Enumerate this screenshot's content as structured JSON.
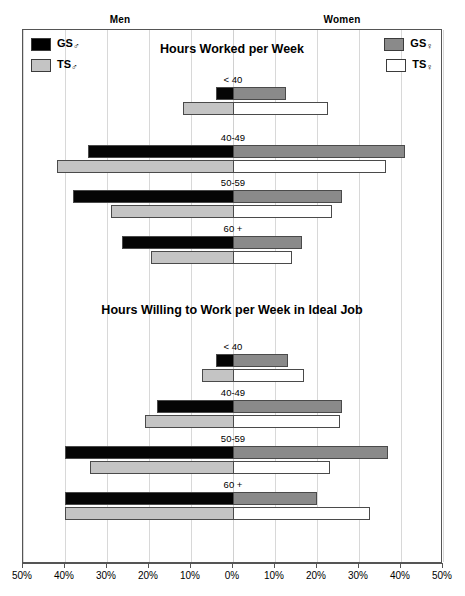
{
  "header": {
    "men_label": "Men",
    "women_label": "Women"
  },
  "legend_left": {
    "items": [
      {
        "key": "gs_m",
        "label": "GS",
        "symbol": "♂",
        "color": "#000000"
      },
      {
        "key": "ts_m",
        "label": "TS",
        "symbol": "♂",
        "color": "#c4c4c4"
      }
    ]
  },
  "legend_right": {
    "items": [
      {
        "key": "gs_w",
        "label": "GS",
        "symbol": "♀",
        "color": "#8a8a8a"
      },
      {
        "key": "ts_w",
        "label": "TS",
        "symbol": "♀",
        "color": "#ffffff"
      }
    ]
  },
  "axis": {
    "tick_labels": [
      "50%",
      "40%",
      "30%",
      "20%",
      "10%",
      "0%",
      "10%",
      "20%",
      "30%",
      "40%",
      "50%"
    ],
    "tick_values": [
      -50,
      -40,
      -30,
      -20,
      -10,
      0,
      10,
      20,
      30,
      40,
      50
    ],
    "min": -50,
    "max": 50
  },
  "chart_data": [
    {
      "type": "bar",
      "orientation": "horizontal",
      "layout": "diverging-bidirectional",
      "title": "Hours Worked per Week",
      "xlabel": "",
      "ylabel": "",
      "xlim": [
        -50,
        50
      ],
      "grid": true,
      "legend_position": "top-left and top-right",
      "categories": [
        "< 40",
        "40-49",
        "50-59",
        "60 +"
      ],
      "series": [
        {
          "name": "GS♂",
          "side": "left",
          "row": "top",
          "color": "#000000",
          "values": [
            4,
            34.5,
            38,
            26.5
          ]
        },
        {
          "name": "GS♀",
          "side": "right",
          "row": "top",
          "color": "#8a8a8a",
          "values": [
            12.5,
            41,
            26,
            16.5
          ]
        },
        {
          "name": "TS♂",
          "side": "left",
          "row": "bottom",
          "color": "#c4c4c4",
          "values": [
            12,
            42,
            29,
            19.5
          ]
        },
        {
          "name": "TS♀",
          "side": "right",
          "row": "bottom",
          "color": "#ffffff",
          "values": [
            22.5,
            36.5,
            23.5,
            14
          ]
        }
      ]
    },
    {
      "type": "bar",
      "orientation": "horizontal",
      "layout": "diverging-bidirectional",
      "title": "Hours Willing to Work per Week in Ideal Job",
      "xlabel": "",
      "ylabel": "",
      "xlim": [
        -50,
        50
      ],
      "grid": true,
      "legend_position": "shared with top panel",
      "categories": [
        "< 40",
        "40-49",
        "50-59",
        "60 +"
      ],
      "series": [
        {
          "name": "GS♂",
          "side": "left",
          "row": "top",
          "color": "#000000",
          "values": [
            4,
            18,
            40,
            40
          ]
        },
        {
          "name": "GS♀",
          "side": "right",
          "row": "top",
          "color": "#8a8a8a",
          "values": [
            13,
            26,
            37,
            20
          ]
        },
        {
          "name": "TS♂",
          "side": "left",
          "row": "bottom",
          "color": "#c4c4c4",
          "values": [
            7.5,
            21,
            34,
            40
          ]
        },
        {
          "name": "TS♀",
          "side": "right",
          "row": "bottom",
          "color": "#ffffff",
          "values": [
            17,
            25.5,
            23,
            32.5
          ]
        }
      ]
    }
  ]
}
